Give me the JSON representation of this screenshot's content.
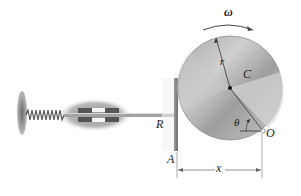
{
  "diagram": {
    "type": "cam-follower mechanism",
    "labels": {
      "omega": "ω",
      "radius": "r",
      "cam": "C",
      "follower": "R",
      "angle": "θ",
      "pivot": "O",
      "point_a": "A",
      "distance": "x"
    },
    "components": [
      {
        "name": "disk-cam",
        "label": "C"
      },
      {
        "name": "follower-rod",
        "label": "R"
      },
      {
        "name": "spring"
      },
      {
        "name": "guide-bearing"
      },
      {
        "name": "wall-support"
      }
    ],
    "colors": {
      "disk": "#b5b5b5",
      "disk_dark": "#8a8a8a",
      "rod": "#9a9a9a",
      "bearing": "#7a7a7a",
      "line": "#555555"
    }
  }
}
